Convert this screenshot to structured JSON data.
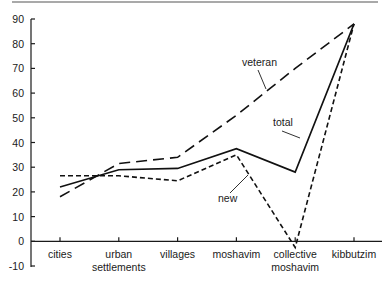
{
  "chart_data": {
    "type": "line",
    "title": "",
    "xlabel": "",
    "ylabel": "",
    "ylim": [
      -10,
      90
    ],
    "yticks": [
      -10,
      0,
      10,
      20,
      30,
      40,
      50,
      60,
      70,
      80,
      90
    ],
    "grid": false,
    "categories": [
      {
        "line1": "cities",
        "line2": ""
      },
      {
        "line1": "urban",
        "line2": "settlements"
      },
      {
        "line1": "villages",
        "line2": ""
      },
      {
        "line1": "moshavim",
        "line2": ""
      },
      {
        "line1": "collective",
        "line2": "moshavim"
      },
      {
        "line1": "kibbutzim",
        "line2": ""
      }
    ],
    "series": [
      {
        "name": "veteran",
        "style": "long-dash",
        "values": [
          18,
          31.5,
          34,
          51,
          70,
          88
        ]
      },
      {
        "name": "total",
        "style": "solid",
        "values": [
          22,
          29,
          29.5,
          37.5,
          28,
          88
        ]
      },
      {
        "name": "new",
        "style": "short-dash",
        "values": [
          26.5,
          26.5,
          24.5,
          35,
          -2.5,
          88
        ]
      }
    ],
    "annotations": [
      {
        "text": "veteran",
        "series": "veteran"
      },
      {
        "text": "total",
        "series": "total"
      },
      {
        "text": "new",
        "series": "new"
      }
    ],
    "legend": "inline-annotations"
  }
}
